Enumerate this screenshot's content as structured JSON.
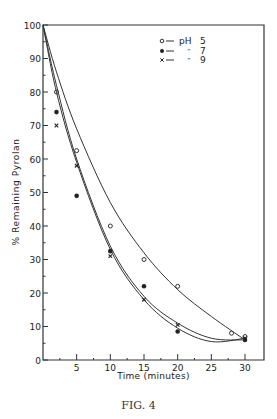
{
  "figure": {
    "caption": "FIG. 4",
    "xlabel": "Time (minutes)",
    "ylabel": "% Remaining Pyrolan"
  },
  "chart_data": {
    "type": "line",
    "title": "",
    "xlabel": "Time (minutes)",
    "ylabel": "% Remaining Pyrolan",
    "xlim": [
      0,
      30
    ],
    "ylim": [
      0,
      100
    ],
    "x_ticks": [
      5,
      10,
      15,
      20,
      25,
      30
    ],
    "y_ticks": [
      0,
      10,
      20,
      30,
      40,
      50,
      60,
      70,
      80,
      90,
      100
    ],
    "grid": false,
    "legend_position": "upper right",
    "legend": [
      "pH 5",
      "\" 7",
      "\" 9"
    ],
    "series": [
      {
        "name": "pH 5",
        "marker": "open-circle",
        "points": [
          [
            2,
            80
          ],
          [
            5,
            62.5
          ],
          [
            10,
            40
          ],
          [
            15,
            30
          ],
          [
            20,
            22
          ],
          [
            28,
            8
          ],
          [
            30,
            7
          ]
        ],
        "curve": [
          [
            0,
            100
          ],
          [
            2,
            86
          ],
          [
            5,
            69
          ],
          [
            10,
            47
          ],
          [
            15,
            32
          ],
          [
            20,
            21
          ],
          [
            25,
            13
          ],
          [
            30,
            6
          ]
        ]
      },
      {
        "name": "pH 7",
        "marker": "filled-circle",
        "points": [
          [
            2,
            74
          ],
          [
            5,
            49
          ],
          [
            10,
            32.5
          ],
          [
            15,
            22
          ],
          [
            20,
            8.5
          ],
          [
            30,
            6
          ]
        ],
        "curve": [
          [
            0,
            100
          ],
          [
            2,
            80
          ],
          [
            5,
            59
          ],
          [
            10,
            33
          ],
          [
            15,
            18
          ],
          [
            20,
            9.5
          ],
          [
            25,
            5.5
          ],
          [
            30,
            6.5
          ]
        ]
      },
      {
        "name": "pH 9",
        "marker": "cross",
        "points": [
          [
            2,
            70
          ],
          [
            5,
            58
          ],
          [
            10,
            31
          ],
          [
            15,
            18
          ],
          [
            20,
            10.5
          ],
          [
            30,
            6.5
          ]
        ],
        "curve": [
          [
            0,
            100
          ],
          [
            2,
            82
          ],
          [
            5,
            60
          ],
          [
            10,
            34
          ],
          [
            15,
            19
          ],
          [
            20,
            11
          ],
          [
            25,
            6.5
          ],
          [
            30,
            6
          ]
        ]
      }
    ]
  }
}
